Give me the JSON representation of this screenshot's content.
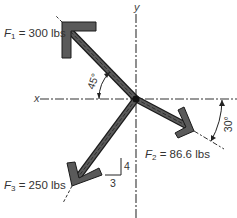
{
  "diagram": {
    "type": "free-body force diagram",
    "axes": {
      "x_label": "x",
      "y_label": "y"
    },
    "forces": [
      {
        "id": "F1",
        "symbol": "F",
        "subscript": "1",
        "value_text": "= 300 lbs",
        "magnitude": 300,
        "unit": "lbs",
        "direction": "up-left",
        "angle_label": "45°",
        "angle_reference": "negative x-axis"
      },
      {
        "id": "F2",
        "symbol": "F",
        "subscript": "2",
        "value_text": "= 86.6 lbs",
        "magnitude": 86.6,
        "unit": "lbs",
        "direction": "down-right",
        "angle_label": "30°",
        "angle_reference": "positive x-axis"
      },
      {
        "id": "F3",
        "symbol": "F",
        "subscript": "3",
        "value_text": "= 250 lbs",
        "magnitude": 250,
        "unit": "lbs",
        "direction": "down-left",
        "slope_triangle": {
          "rise": "4",
          "run": "3"
        }
      }
    ],
    "colors": {
      "arrow_fill": "#555555",
      "arrow_stroke": "#1a1a1a",
      "axis": "#333333",
      "text": "#333333"
    }
  }
}
